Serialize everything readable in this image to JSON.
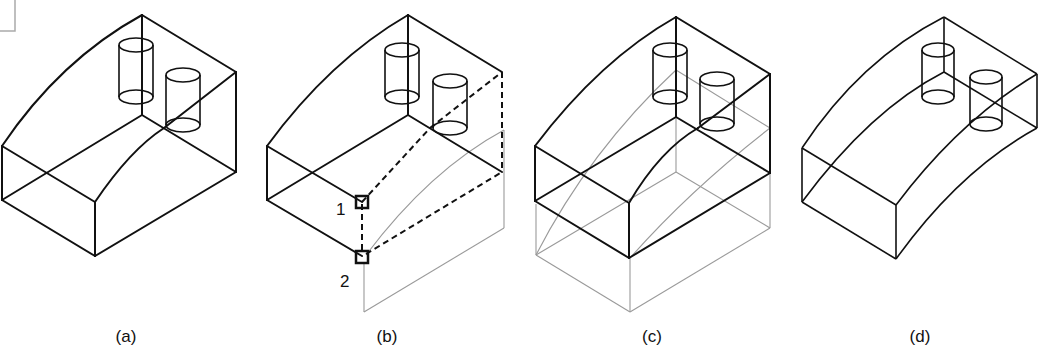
{
  "figure": {
    "panels": [
      {
        "id": "a",
        "caption": "(a)"
      },
      {
        "id": "b",
        "caption": "(b)",
        "point_labels": [
          "1",
          "2"
        ]
      },
      {
        "id": "c",
        "caption": "(c)"
      },
      {
        "id": "d",
        "caption": "(d)"
      }
    ],
    "colors": {
      "line": "#111111",
      "ghost": "#9a9a9a",
      "background": "#ffffff"
    }
  }
}
